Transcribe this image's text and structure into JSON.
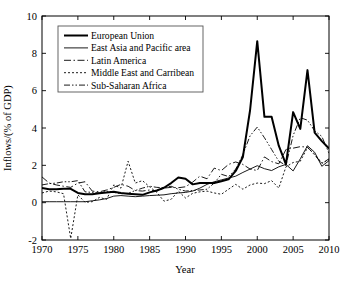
{
  "chart_data": {
    "type": "line",
    "title": "",
    "xlabel": "Year",
    "ylabel": "Inflows/(% of GDP)",
    "xlim": [
      1970,
      2010
    ],
    "ylim": [
      -2,
      10
    ],
    "xticks": [
      1970,
      1975,
      1980,
      1985,
      1990,
      1995,
      2000,
      2005,
      2010
    ],
    "yticks": [
      -2,
      0,
      2,
      4,
      6,
      8,
      10
    ],
    "xtick_labels": [
      "1970",
      "1975",
      "1980",
      "1985",
      "1990",
      "1995",
      "2000",
      "2005",
      "2010"
    ],
    "ytick_labels": [
      "-2",
      "0",
      "2",
      "4",
      "6",
      "8",
      "10"
    ],
    "grid": false,
    "legend_position": "upper-left",
    "x": [
      1970,
      1971,
      1972,
      1973,
      1974,
      1975,
      1976,
      1977,
      1978,
      1979,
      1980,
      1981,
      1982,
      1983,
      1984,
      1985,
      1986,
      1987,
      1988,
      1989,
      1990,
      1991,
      1992,
      1993,
      1994,
      1995,
      1996,
      1997,
      1998,
      1999,
      2000,
      2001,
      2002,
      2003,
      2004,
      2005,
      2006,
      2007,
      2008,
      2009,
      2010
    ],
    "series": [
      {
        "name": "European Union",
        "style": "solid-thick",
        "line_width": 2.0,
        "dash": "none",
        "values": [
          0.78,
          0.72,
          0.72,
          0.74,
          0.74,
          0.52,
          0.45,
          0.45,
          0.5,
          0.55,
          0.58,
          0.52,
          0.48,
          0.45,
          0.42,
          0.55,
          0.65,
          0.8,
          1.05,
          1.35,
          1.28,
          0.98,
          1.05,
          1.05,
          1.05,
          1.15,
          1.25,
          1.7,
          2.45,
          4.95,
          8.65,
          4.6,
          4.6,
          3.05,
          2.05,
          4.85,
          3.95,
          7.1,
          3.75,
          3.3,
          2.9
        ]
      },
      {
        "name": "East Asia and Pacific area",
        "style": "solid-thin",
        "line_width": 0.9,
        "dash": "none",
        "values": [
          0.05,
          0.05,
          0.05,
          0.05,
          0.05,
          0.05,
          0.05,
          0.1,
          0.15,
          0.22,
          0.35,
          0.38,
          0.35,
          0.32,
          0.35,
          0.38,
          0.4,
          0.42,
          0.48,
          0.52,
          0.55,
          0.62,
          0.78,
          0.98,
          1.12,
          1.22,
          1.32,
          1.42,
          1.62,
          1.8,
          1.98,
          1.82,
          1.72,
          1.92,
          2.05,
          1.7,
          2.35,
          3.05,
          2.7,
          1.95,
          2.25
        ]
      },
      {
        "name": "Latin America",
        "style": "dash-dot",
        "line_width": 0.9,
        "dash": "7,2.5,1.5,2.5",
        "values": [
          1.38,
          1.05,
          0.95,
          0.88,
          0.82,
          1.05,
          1.12,
          0.62,
          0.58,
          0.68,
          0.82,
          0.98,
          0.88,
          0.65,
          0.62,
          0.68,
          0.62,
          0.78,
          0.82,
          0.8,
          0.85,
          1.1,
          1.42,
          1.28,
          1.85,
          1.72,
          2.05,
          2.18,
          2.05,
          1.8,
          1.72,
          2.45,
          2.2,
          2.08,
          2.85,
          2.92,
          3.0,
          2.98,
          2.55,
          2.1,
          2.35
        ]
      },
      {
        "name": "Middle East and Carribean",
        "style": "dotted",
        "line_width": 0.9,
        "dash": "2,2",
        "values": [
          0.52,
          0.62,
          0.58,
          0.48,
          -1.92,
          0.42,
          0.02,
          0.05,
          0.28,
          0.18,
          0.95,
          0.78,
          2.22,
          1.05,
          1.18,
          0.85,
          0.55,
          0.08,
          0.18,
          0.62,
          0.25,
          0.5,
          0.58,
          0.62,
          0.52,
          0.45,
          0.72,
          0.98,
          0.72,
          0.95,
          1.05,
          1.02,
          1.18,
          0.78,
          1.92,
          2.15,
          2.22,
          2.95,
          2.6,
          2.12,
          2.3
        ]
      },
      {
        "name": "Sub-Saharan Africa",
        "style": "dash-dot-dot",
        "line_width": 0.9,
        "dash": "6,2,1.5,2,1.5,2",
        "values": [
          0.95,
          1.02,
          1.05,
          1.12,
          1.12,
          1.18,
          0.58,
          0.55,
          0.52,
          0.62,
          0.55,
          0.48,
          0.5,
          0.65,
          0.78,
          0.88,
          0.82,
          0.8,
          0.88,
          0.72,
          0.62,
          0.65,
          0.68,
          0.72,
          1.05,
          1.52,
          1.4,
          1.8,
          2.58,
          3.58,
          4.05,
          3.48,
          2.85,
          2.22,
          2.0,
          3.6,
          4.55,
          4.42,
          3.85,
          3.55,
          2.65
        ]
      }
    ]
  },
  "legend": {
    "entries": [
      {
        "label": "European Union"
      },
      {
        "label": "East Asia and Pacific area"
      },
      {
        "label": "Latin America"
      },
      {
        "label": "Middle East and Carribean"
      },
      {
        "label": "Sub-Saharan Africa"
      }
    ]
  },
  "colors": {
    "line": "#000000",
    "axis": "#000000",
    "background": "#ffffff",
    "legend_border": "#555555"
  }
}
